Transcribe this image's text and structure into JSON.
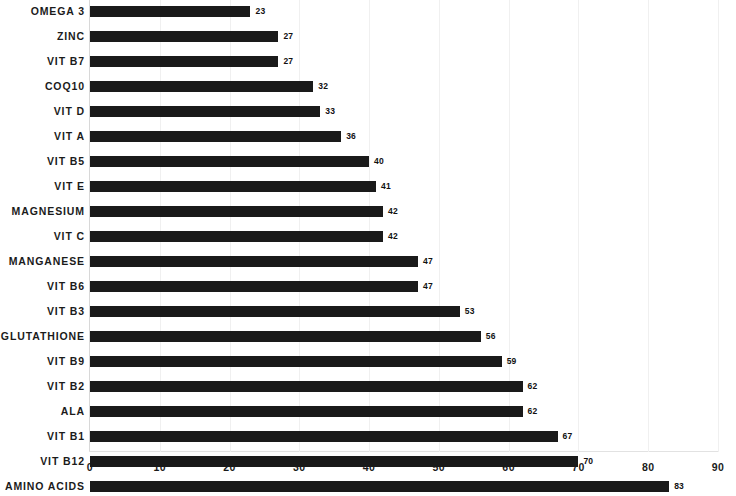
{
  "chart_data": {
    "type": "bar",
    "orientation": "horizontal",
    "title": "",
    "subtitle": "",
    "xlabel": "",
    "ylabel": "",
    "xlim": [
      0,
      90
    ],
    "xticks": [
      0,
      10,
      20,
      30,
      40,
      50,
      60,
      70,
      80,
      90
    ],
    "xtick_labels": [
      "0",
      "10",
      "20",
      "30",
      "40",
      "50",
      "60",
      "70",
      "80",
      "90"
    ],
    "grid": false,
    "legend": null,
    "bar_color": "#1a1a1a",
    "show_value_labels": true,
    "categories": [
      "OMEGA 3",
      "ZINC",
      "VIT B7",
      "COQ10",
      "VIT D",
      "VIT A",
      "VIT B5",
      "VIT E",
      "MAGNESIUM",
      "VIT C",
      "MANGANESE",
      "VIT B6",
      "VIT B3",
      "GLUTATHIONE",
      "VIT B9",
      "VIT B2",
      "ALA",
      "VIT B1",
      "VIT B12",
      "AMINO ACIDS"
    ],
    "values": [
      23,
      27,
      27,
      32,
      33,
      36,
      40,
      41,
      42,
      42,
      47,
      47,
      53,
      56,
      59,
      62,
      62,
      67,
      70,
      83
    ],
    "value_labels": [
      "23",
      "27",
      "27",
      "32",
      "33",
      "36",
      "40",
      "41",
      "42",
      "42",
      "47",
      "47",
      "53",
      "56",
      "59",
      "62",
      "62",
      "67",
      "70",
      "83"
    ]
  }
}
